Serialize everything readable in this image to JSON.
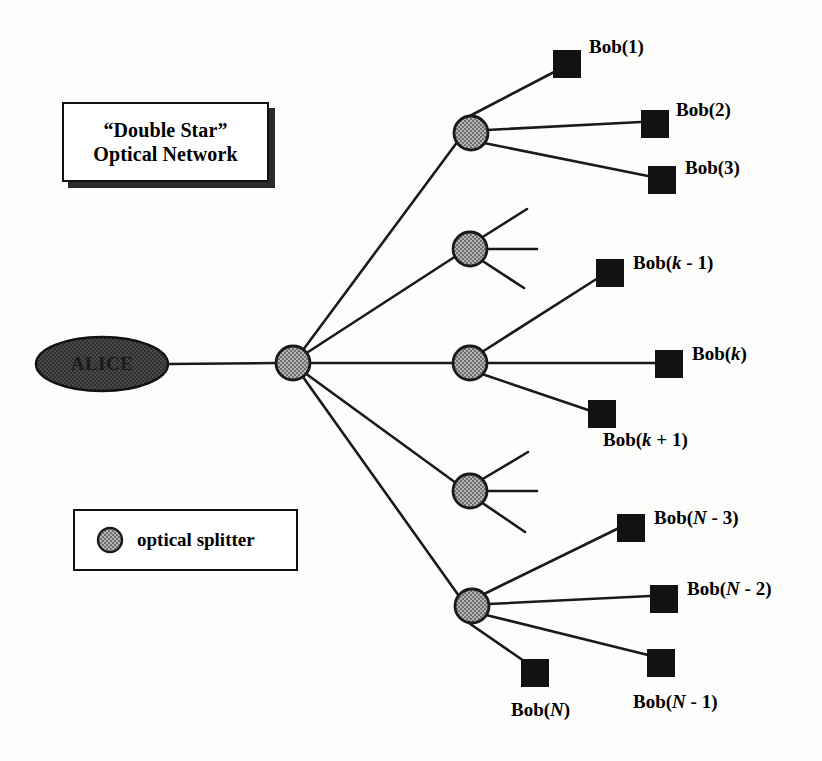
{
  "figure": {
    "title_lines": [
      "“Double Star”",
      "Optical Network"
    ],
    "source_node_label": "ALICE",
    "legend": {
      "swatch_icon": "optical-splitter-circle-icon",
      "label": "optical splitter"
    },
    "colors": {
      "background": "#fdfdfc",
      "line": "#1a1a1a",
      "terminal_fill": "#121212",
      "splitter_fill": "#9a9a9a",
      "splitter_stroke": "#1a1a1a",
      "source_fill": "#3a3a3a",
      "text": "#000000",
      "box_border": "#111111",
      "box_shadow": "#2b2b2b"
    }
  },
  "diagram_data": {
    "type": "node-link-tree",
    "topology": "double star passive optical network",
    "nodes": {
      "source": {
        "name": "ALICE",
        "shape": "ellipse",
        "x": 102,
        "y": 364,
        "rx": 66,
        "ry": 27
      },
      "primary_splitter": {
        "name": "central optical splitter",
        "shape": "circle",
        "x": 293,
        "y": 363,
        "r": 17,
        "fanout": 5
      },
      "secondary_splitters": [
        {
          "id": "splitter-1",
          "x": 471,
          "y": 133,
          "r": 17,
          "terminals": 3,
          "stubs": 0
        },
        {
          "id": "splitter-2",
          "x": 470,
          "y": 249,
          "r": 17,
          "terminals": 0,
          "stubs": 3
        },
        {
          "id": "splitter-3",
          "x": 470,
          "y": 363,
          "r": 17,
          "terminals": 3,
          "stubs": 0
        },
        {
          "id": "splitter-4",
          "x": 470,
          "y": 491,
          "r": 17,
          "terminals": 0,
          "stubs": 3
        },
        {
          "id": "splitter-5",
          "x": 472,
          "y": 606,
          "r": 17,
          "terminals": 3,
          "stubs": 0
        }
      ]
    },
    "terminals": [
      {
        "id": "bob-1",
        "label_html": "Bob(1)",
        "label_text": "Bob(1)",
        "sq_x": 553,
        "sq_y": 50,
        "lbl_x": 589,
        "lbl_y": 36,
        "parent": "splitter-1"
      },
      {
        "id": "bob-2",
        "label_html": "Bob(2)",
        "label_text": "Bob(2)",
        "sq_x": 641,
        "sq_y": 110,
        "lbl_x": 676,
        "lbl_y": 99,
        "parent": "splitter-1"
      },
      {
        "id": "bob-3",
        "label_html": "Bob(3)",
        "label_text": "Bob(3)",
        "sq_x": 648,
        "sq_y": 166,
        "lbl_x": 685,
        "lbl_y": 157,
        "parent": "splitter-1"
      },
      {
        "id": "bob-k-1",
        "label_html": "Bob(<i>k</i> - 1)",
        "label_text": "Bob(k - 1)",
        "sq_x": 596,
        "sq_y": 259,
        "lbl_x": 633,
        "lbl_y": 252,
        "parent": "splitter-3"
      },
      {
        "id": "bob-k",
        "label_html": "Bob(<i>k</i>)",
        "label_text": "Bob(k)",
        "sq_x": 655,
        "sq_y": 350,
        "lbl_x": 692,
        "lbl_y": 343,
        "parent": "splitter-3"
      },
      {
        "id": "bob-k+1",
        "label_html": "Bob(<i>k</i> + 1)",
        "label_text": "Bob(k + 1)",
        "sq_x": 588,
        "sq_y": 400,
        "lbl_x": 603,
        "lbl_y": 429,
        "parent": "splitter-3"
      },
      {
        "id": "bob-N-3",
        "label_html": "Bob(<i>N</i> - 3)",
        "label_text": "Bob(N - 3)",
        "sq_x": 617,
        "sq_y": 514,
        "lbl_x": 654,
        "lbl_y": 507,
        "parent": "splitter-5"
      },
      {
        "id": "bob-N-2",
        "label_html": "Bob(<i>N</i> - 2)",
        "label_text": "Bob(N - 2)",
        "sq_x": 650,
        "sq_y": 585,
        "lbl_x": 687,
        "lbl_y": 578,
        "parent": "splitter-5"
      },
      {
        "id": "bob-N-1",
        "label_html": "Bob(<i>N</i> - 1)",
        "label_text": "Bob(N - 1)",
        "sq_x": 647,
        "sq_y": 649,
        "lbl_x": 633,
        "lbl_y": 691,
        "parent": "splitter-5"
      },
      {
        "id": "bob-N",
        "label_html": "Bob(<i>N</i>)",
        "label_text": "Bob(N)",
        "sq_x": 521,
        "sq_y": 659,
        "lbl_x": 511,
        "lbl_y": 699,
        "parent": "splitter-5"
      }
    ],
    "edges": [
      {
        "from": "source",
        "to": "primary_splitter"
      },
      {
        "from": "primary_splitter",
        "to": "splitter-1"
      },
      {
        "from": "primary_splitter",
        "to": "splitter-2"
      },
      {
        "from": "primary_splitter",
        "to": "splitter-3"
      },
      {
        "from": "primary_splitter",
        "to": "splitter-4"
      },
      {
        "from": "primary_splitter",
        "to": "splitter-5"
      },
      {
        "from": "splitter-1",
        "to": "bob-1"
      },
      {
        "from": "splitter-1",
        "to": "bob-2"
      },
      {
        "from": "splitter-1",
        "to": "bob-3"
      },
      {
        "from": "splitter-3",
        "to": "bob-k-1"
      },
      {
        "from": "splitter-3",
        "to": "bob-k"
      },
      {
        "from": "splitter-3",
        "to": "bob-k+1"
      },
      {
        "from": "splitter-5",
        "to": "bob-N-3"
      },
      {
        "from": "splitter-5",
        "to": "bob-N-2"
      },
      {
        "from": "splitter-5",
        "to": "bob-N-1"
      },
      {
        "from": "splitter-5",
        "to": "bob-N"
      }
    ]
  }
}
